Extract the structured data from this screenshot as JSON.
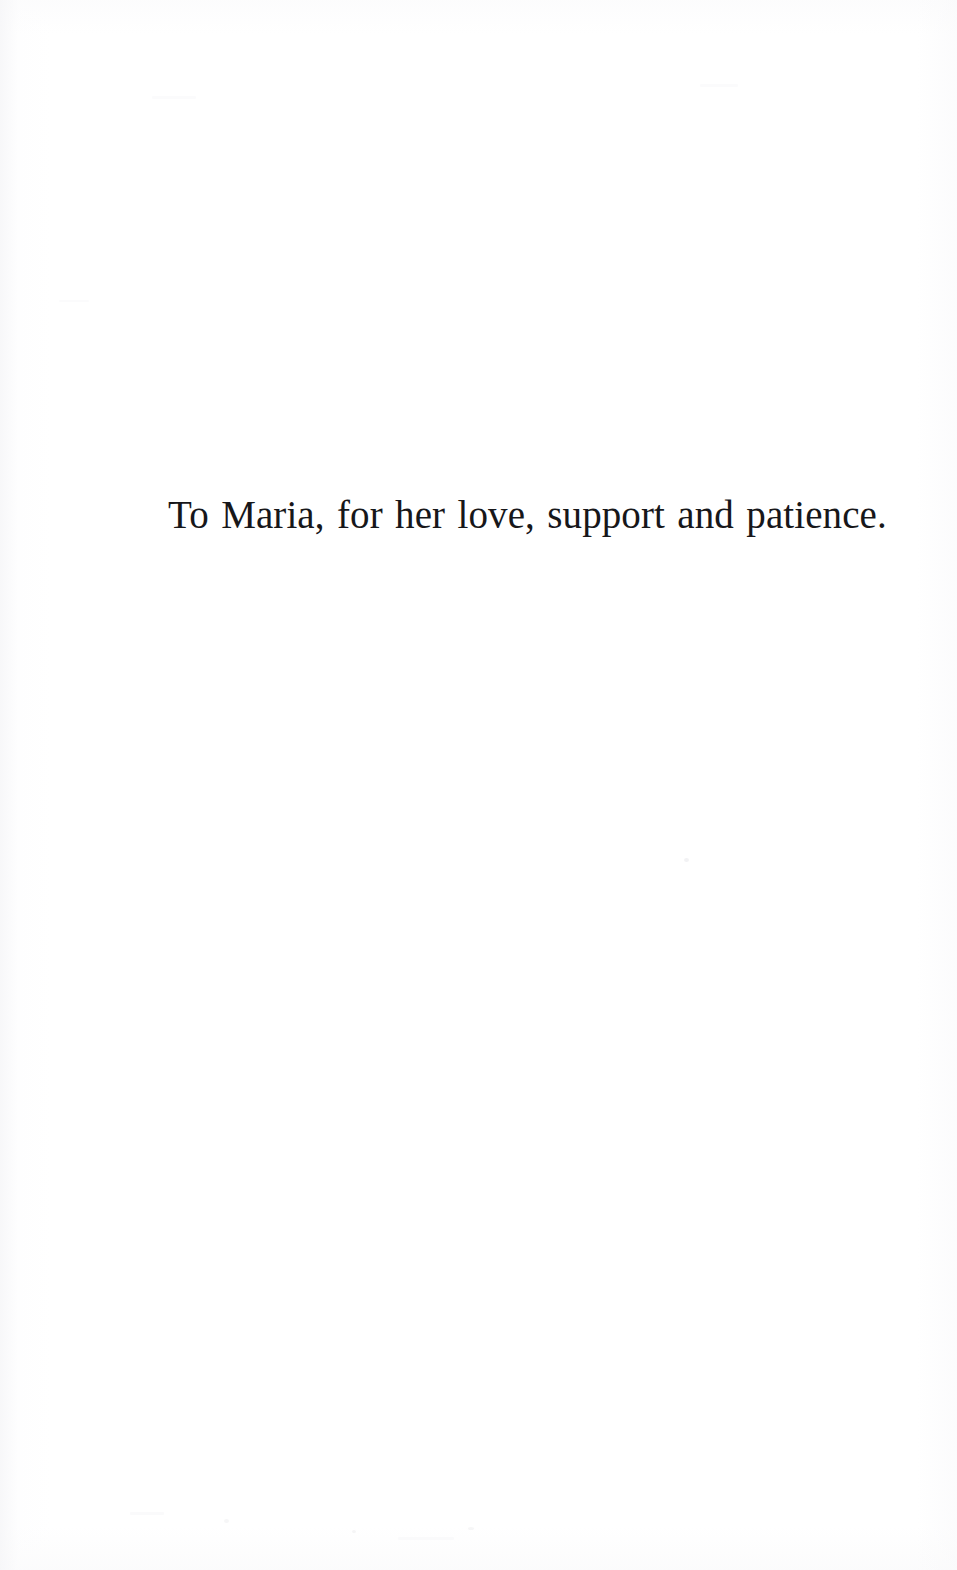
{
  "page": {
    "kind": "book-dedication-page",
    "background_color": "#ffffff",
    "ink_color": "#17171a",
    "width": 957,
    "height": 1570
  },
  "dedication": {
    "text": "To Maria, for her love, support and patience."
  }
}
